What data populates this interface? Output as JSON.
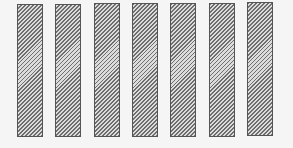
{
  "diagram": {
    "background_color": "#f5f5f5",
    "bar_border_color": "#555555",
    "hatch_color": "#6e6e6e",
    "hatch_background": "#dcdcdc",
    "bar_count": 7,
    "bars": [
      {
        "x": 17,
        "y": 4,
        "width": 26,
        "height": 133
      },
      {
        "x": 55,
        "y": 4,
        "width": 26,
        "height": 133
      },
      {
        "x": 94,
        "y": 3,
        "width": 26,
        "height": 134
      },
      {
        "x": 132,
        "y": 3,
        "width": 26,
        "height": 134
      },
      {
        "x": 170,
        "y": 3,
        "width": 26,
        "height": 134
      },
      {
        "x": 209,
        "y": 3,
        "width": 26,
        "height": 134
      },
      {
        "x": 247,
        "y": 2,
        "width": 26,
        "height": 134
      }
    ]
  }
}
